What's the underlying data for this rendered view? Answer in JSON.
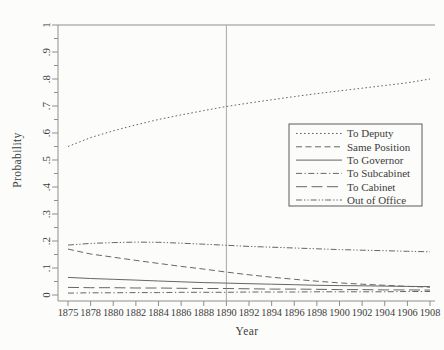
{
  "chart_data": {
    "type": "line",
    "title": "",
    "xlabel": "Year",
    "ylabel": "Probability",
    "x_tick_labels": [
      "1875",
      "1878",
      "1880",
      "1882",
      "1884",
      "1886",
      "1888",
      "1890",
      "1892",
      "1894",
      "1896",
      "1898",
      "1900",
      "1902",
      "1904",
      "1906",
      "1908"
    ],
    "ylim": [
      0,
      1
    ],
    "y_ticks": [
      0,
      0.1,
      0.2,
      0.3,
      0.4,
      0.5,
      0.6,
      0.7,
      0.8,
      0.9,
      1
    ],
    "y_tick_labels": [
      "0",
      ".1",
      ".2",
      ".3",
      ".4",
      ".5",
      ".6",
      ".7",
      ".8",
      ".9",
      "1"
    ],
    "y_minor_ticks": [
      0.05,
      0.15,
      0.25,
      0.35,
      0.45,
      0.55,
      0.65,
      0.75,
      0.85,
      0.95
    ],
    "grid": false,
    "reference_line_x": "1890",
    "legend_position": "middle-right",
    "series": [
      {
        "name": "To Deputy",
        "style": "dotted",
        "values": [
          0.55,
          0.583,
          0.608,
          0.63,
          0.65,
          0.667,
          0.683,
          0.698,
          0.711,
          0.723,
          0.735,
          0.746,
          0.756,
          0.766,
          0.776,
          0.786,
          0.8
        ]
      },
      {
        "name": "Same Position",
        "style": "dashed",
        "values": [
          0.17,
          0.152,
          0.14,
          0.128,
          0.117,
          0.106,
          0.096,
          0.085,
          0.075,
          0.066,
          0.058,
          0.051,
          0.045,
          0.04,
          0.036,
          0.032,
          0.029
        ]
      },
      {
        "name": "To Governor",
        "style": "solid",
        "values": [
          0.065,
          0.061,
          0.058,
          0.055,
          0.052,
          0.049,
          0.046,
          0.044,
          0.042,
          0.04,
          0.038,
          0.036,
          0.035,
          0.034,
          0.033,
          0.032,
          0.031
        ]
      },
      {
        "name": "To Subcabinet",
        "style": "dashdot",
        "values": [
          0.007,
          0.008,
          0.008,
          0.009,
          0.009,
          0.01,
          0.01,
          0.01,
          0.011,
          0.011,
          0.011,
          0.012,
          0.012,
          0.012,
          0.012,
          0.013,
          0.013
        ]
      },
      {
        "name": "To Cabinet",
        "style": "longdash",
        "values": [
          0.028,
          0.027,
          0.027,
          0.026,
          0.026,
          0.025,
          0.024,
          0.024,
          0.023,
          0.022,
          0.022,
          0.021,
          0.02,
          0.02,
          0.019,
          0.019,
          0.018
        ]
      },
      {
        "name": "Out of Office",
        "style": "dashdotdot",
        "values": [
          0.185,
          0.191,
          0.194,
          0.196,
          0.195,
          0.192,
          0.188,
          0.184,
          0.18,
          0.177,
          0.174,
          0.171,
          0.168,
          0.166,
          0.164,
          0.162,
          0.16
        ]
      }
    ]
  },
  "colors": {
    "background": "#fcfcfa",
    "line": "#666666",
    "axis": "#8f8f8f",
    "ref_line": "#a8a8a8",
    "text": "#3d3d3d",
    "legend_border": "#5a5a5a",
    "legend_fill": "#fcfcfa"
  }
}
